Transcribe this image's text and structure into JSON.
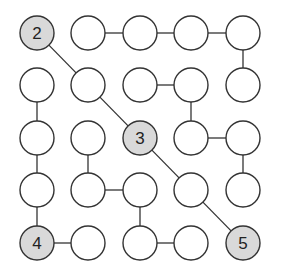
{
  "puzzle": {
    "type": "connect-the-circles",
    "rows": 5,
    "cols": 5,
    "colors": {
      "background": "#ffffff",
      "circle_fill": "#ffffff",
      "shaded_fill": "#d9d9d9",
      "stroke": "#333333",
      "text": "#222222"
    },
    "geometry": {
      "col_x": [
        37,
        88,
        140,
        191,
        243
      ],
      "row_y": [
        33,
        85,
        138,
        190,
        243
      ],
      "radius": 17
    },
    "cells": [
      {
        "r": 0,
        "c": 0,
        "label": "2",
        "shaded": true
      },
      {
        "r": 0,
        "c": 1,
        "label": "",
        "shaded": false
      },
      {
        "r": 0,
        "c": 2,
        "label": "",
        "shaded": false
      },
      {
        "r": 0,
        "c": 3,
        "label": "",
        "shaded": false
      },
      {
        "r": 0,
        "c": 4,
        "label": "",
        "shaded": false
      },
      {
        "r": 1,
        "c": 0,
        "label": "",
        "shaded": false
      },
      {
        "r": 1,
        "c": 1,
        "label": "",
        "shaded": false
      },
      {
        "r": 1,
        "c": 2,
        "label": "",
        "shaded": false
      },
      {
        "r": 1,
        "c": 3,
        "label": "",
        "shaded": false
      },
      {
        "r": 1,
        "c": 4,
        "label": "",
        "shaded": false
      },
      {
        "r": 2,
        "c": 0,
        "label": "",
        "shaded": false
      },
      {
        "r": 2,
        "c": 1,
        "label": "",
        "shaded": false
      },
      {
        "r": 2,
        "c": 2,
        "label": "3",
        "shaded": true
      },
      {
        "r": 2,
        "c": 3,
        "label": "",
        "shaded": false
      },
      {
        "r": 2,
        "c": 4,
        "label": "",
        "shaded": false
      },
      {
        "r": 3,
        "c": 0,
        "label": "",
        "shaded": false
      },
      {
        "r": 3,
        "c": 1,
        "label": "",
        "shaded": false
      },
      {
        "r": 3,
        "c": 2,
        "label": "",
        "shaded": false
      },
      {
        "r": 3,
        "c": 3,
        "label": "",
        "shaded": false
      },
      {
        "r": 3,
        "c": 4,
        "label": "",
        "shaded": false
      },
      {
        "r": 4,
        "c": 0,
        "label": "4",
        "shaded": true
      },
      {
        "r": 4,
        "c": 1,
        "label": "",
        "shaded": false
      },
      {
        "r": 4,
        "c": 2,
        "label": "",
        "shaded": false
      },
      {
        "r": 4,
        "c": 3,
        "label": "",
        "shaded": false
      },
      {
        "r": 4,
        "c": 4,
        "label": "5",
        "shaded": true
      }
    ],
    "edges": [
      [
        [
          0,
          1
        ],
        [
          0,
          2
        ]
      ],
      [
        [
          0,
          2
        ],
        [
          0,
          3
        ]
      ],
      [
        [
          0,
          3
        ],
        [
          0,
          4
        ]
      ],
      [
        [
          0,
          4
        ],
        [
          1,
          4
        ]
      ],
      [
        [
          0,
          0
        ],
        [
          1,
          1
        ]
      ],
      [
        [
          1,
          1
        ],
        [
          2,
          2
        ]
      ],
      [
        [
          1,
          2
        ],
        [
          1,
          3
        ]
      ],
      [
        [
          1,
          3
        ],
        [
          2,
          3
        ]
      ],
      [
        [
          1,
          0
        ],
        [
          2,
          0
        ]
      ],
      [
        [
          2,
          0
        ],
        [
          3,
          0
        ]
      ],
      [
        [
          3,
          0
        ],
        [
          4,
          0
        ]
      ],
      [
        [
          2,
          1
        ],
        [
          3,
          1
        ]
      ],
      [
        [
          3,
          1
        ],
        [
          3,
          2
        ]
      ],
      [
        [
          3,
          2
        ],
        [
          4,
          2
        ]
      ],
      [
        [
          2,
          3
        ],
        [
          2,
          4
        ]
      ],
      [
        [
          2,
          4
        ],
        [
          3,
          4
        ]
      ],
      [
        [
          2,
          2
        ],
        [
          3,
          3
        ]
      ],
      [
        [
          3,
          3
        ],
        [
          4,
          4
        ]
      ],
      [
        [
          4,
          0
        ],
        [
          4,
          1
        ]
      ],
      [
        [
          4,
          2
        ],
        [
          4,
          3
        ]
      ]
    ]
  }
}
